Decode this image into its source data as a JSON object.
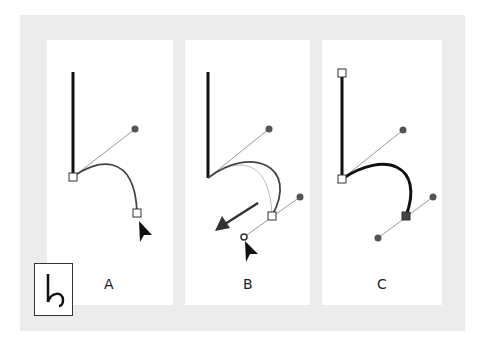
{
  "figure": {
    "panels": [
      {
        "id": "A",
        "label": "A"
      },
      {
        "id": "B",
        "label": "B"
      },
      {
        "id": "C",
        "label": "C"
      }
    ],
    "tool_icon": "convert-anchor-point-icon",
    "colors": {
      "path": "#111111",
      "handle_line": "#999999",
      "handle_dot": "#555555",
      "outer_bg": "#ececec"
    }
  }
}
